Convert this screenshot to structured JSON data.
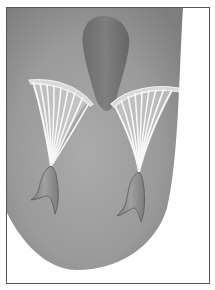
{
  "figure": {
    "parts": [
      "left-ventricle",
      "aortic-outflow",
      "anterior-leaflet",
      "posterior-leaflet",
      "chordae-tendineae",
      "papillary-muscles"
    ],
    "colors": {
      "background": "#ffffff",
      "frame_border": "#555555",
      "ventricle_light": "#a8a8a8",
      "ventricle_dark": "#7a7a7a",
      "outflow": "#6e6e6e",
      "leaflet_rim": "#d8d8d8",
      "chordae": "#f4f4f4",
      "papillary": "#8c8c8c"
    }
  }
}
